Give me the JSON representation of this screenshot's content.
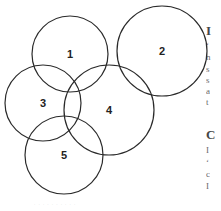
{
  "figure": {
    "type": "overlapping-circles-diagram",
    "stroke_color": "#2a2a2a",
    "circles": [
      {
        "label": "1",
        "cx": 70,
        "cy": 54,
        "r": 38
      },
      {
        "label": "2",
        "cx": 162,
        "cy": 51,
        "r": 45
      },
      {
        "label": "3",
        "cx": 43,
        "cy": 103,
        "r": 38
      },
      {
        "label": "4",
        "cx": 109,
        "cy": 110,
        "r": 45
      },
      {
        "label": "5",
        "cx": 64,
        "cy": 155,
        "r": 39
      }
    ]
  },
  "edge_text": {
    "lines": [
      {
        "text": "I",
        "top": 26,
        "heading": true
      },
      {
        "text": "‘",
        "top": 40
      },
      {
        "text": "n",
        "top": 52
      },
      {
        "text": "s",
        "top": 64
      },
      {
        "text": "s",
        "top": 75
      },
      {
        "text": "a",
        "top": 86
      },
      {
        "text": "t",
        "top": 97
      },
      {
        "text": "C",
        "top": 130,
        "heading": true
      },
      {
        "text": "I",
        "top": 145
      },
      {
        "text": "‘",
        "top": 157
      },
      {
        "text": "c",
        "top": 169
      },
      {
        "text": "I",
        "top": 181
      }
    ]
  },
  "caption": {
    "text": "· · · · · · · · · ·"
  }
}
